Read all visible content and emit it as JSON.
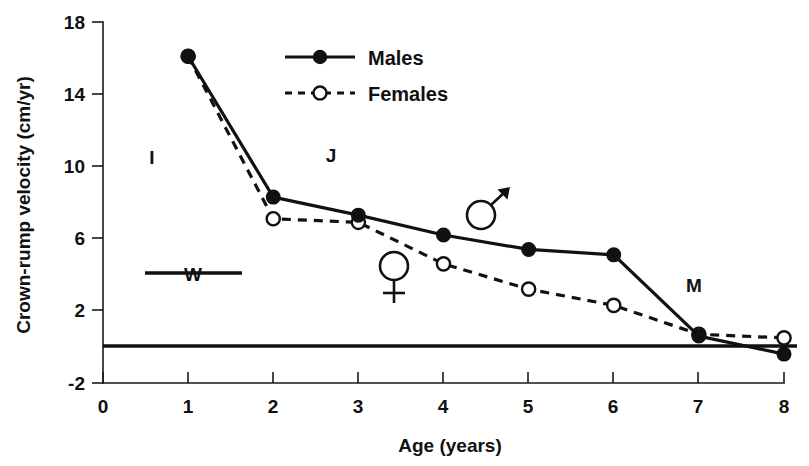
{
  "chart_data": {
    "type": "line",
    "title": "",
    "xlabel": "Age (years)",
    "ylabel": "Crown-rump velocity (cm/yr)",
    "xlim": [
      0,
      8
    ],
    "ylim": [
      -2,
      18
    ],
    "xticks": [
      0,
      1,
      2,
      3,
      4,
      5,
      6,
      7,
      8
    ],
    "yticks": [
      -2,
      2,
      6,
      10,
      14,
      18
    ],
    "xtick_labels": [
      "0",
      "1",
      "2",
      "3",
      "4",
      "5",
      "6",
      "7",
      "8"
    ],
    "ytick_labels": [
      "-2",
      "2",
      "6",
      "10",
      "14",
      "18"
    ],
    "grid": false,
    "legend_position": "top-center",
    "x": [
      1,
      2,
      3,
      4,
      5,
      6,
      7,
      8
    ],
    "series": [
      {
        "name": "Males",
        "line_style": "solid",
        "marker": "filled-circle",
        "values": [
          16.1,
          8.3,
          7.3,
          6.2,
          5.4,
          5.1,
          0.6,
          -0.4
        ]
      },
      {
        "name": "Females",
        "line_style": "dashed",
        "marker": "open-circle",
        "values": [
          16.1,
          7.1,
          6.9,
          4.6,
          3.2,
          2.3,
          0.7,
          0.5
        ]
      }
    ],
    "annotations": [
      {
        "id": "stage-I",
        "text": "I",
        "x": 1.3,
        "y": 10.2
      },
      {
        "id": "stage-J",
        "text": "J",
        "x": 3.0,
        "y": 10.3
      },
      {
        "id": "stage-M",
        "text": "M",
        "x": 7.0,
        "y": 3.3
      },
      {
        "id": "weaning-W",
        "text": "W",
        "x": 1.1,
        "y": 4.1
      },
      {
        "id": "male-symbol",
        "text": "♂",
        "x": 4.6,
        "y": 7.2
      },
      {
        "id": "female-symbol",
        "text": "♀",
        "x": 3.45,
        "y": 4.6
      }
    ],
    "zero_reference_line": 0
  },
  "axes": {
    "y_label": "Crown-rump velocity (cm/yr)",
    "x_label": "Age (years)",
    "y_ticks": [
      "18",
      "14",
      "10",
      "6",
      "2",
      "-2"
    ],
    "x_ticks": [
      "0",
      "1",
      "2",
      "3",
      "4",
      "5",
      "6",
      "7",
      "8"
    ]
  },
  "legend": {
    "entries": [
      {
        "label": "Males",
        "style": "solid",
        "marker": "filled-circle"
      },
      {
        "label": "Females",
        "style": "dashed",
        "marker": "open-circle"
      }
    ]
  },
  "annotations": {
    "infant": "I",
    "juvenile": "J",
    "mature": "M",
    "weaning": "W",
    "male_symbol": "♂",
    "female_symbol": "♀"
  }
}
